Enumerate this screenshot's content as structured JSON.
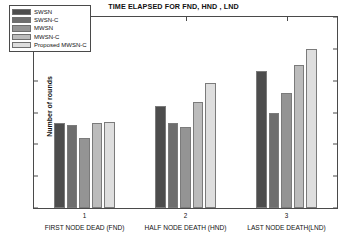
{
  "chart_data": {
    "type": "bar",
    "title": "TIME ELAPSED FOR FND, HND , LND",
    "xlabel": "",
    "ylabel": "Number of rounds",
    "ylim": [
      0,
      3000
    ],
    "ytick_labels": [
      "0",
      "500",
      "1000",
      "1500",
      "2000",
      "2500",
      "3000"
    ],
    "yticks": [
      0,
      500,
      1000,
      1500,
      2000,
      2500,
      3000
    ],
    "grid": false,
    "legend_position": "upper-left",
    "categories": [
      "FIRST NODE DEAD (FND)",
      "HALF NODE DEATH (HND)",
      "LAST NODE DEATH(LND)"
    ],
    "xtick_labels": [
      "1",
      "2",
      "3"
    ],
    "series": [
      {
        "name": "SWSN",
        "color": "#4d4d4d",
        "values": [
          1340,
          1610,
          2150
        ]
      },
      {
        "name": "SWSN-C",
        "color": "#6e6e6e",
        "values": [
          1310,
          1330,
          1500
        ]
      },
      {
        "name": "MWSN",
        "color": "#949494",
        "values": [
          1100,
          1270,
          1800
        ]
      },
      {
        "name": "MWSN-C",
        "color": "#bcbcbc",
        "values": [
          1330,
          1670,
          2250
        ]
      },
      {
        "name": "Proposed MWSN-C",
        "color": "#dedede",
        "values": [
          1345,
          1960,
          2500
        ]
      }
    ]
  },
  "legend": {
    "items": [
      {
        "label": "SWSN"
      },
      {
        "label": "SWSN-C"
      },
      {
        "label": "MWSN"
      },
      {
        "label": "MWSN-C"
      },
      {
        "label": "Proposed MWSN-C"
      }
    ]
  }
}
